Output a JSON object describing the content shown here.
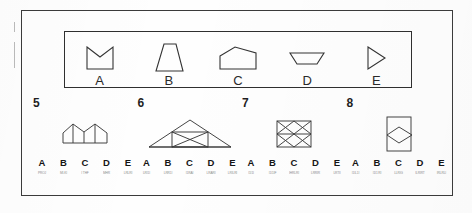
{
  "page": {
    "kind": "spatial-reasoning-test-sheet",
    "frame_color": "#3b3b3b",
    "ink_color": "#333333",
    "background_color": "#fefefe"
  },
  "answer_key": {
    "shapes": [
      {
        "label": "A",
        "icon": "square-with-v-notch-top-shape"
      },
      {
        "label": "B",
        "icon": "trapezoid-narrow-top-shape"
      },
      {
        "label": "C",
        "icon": "pentagon-house-shape"
      },
      {
        "label": "D",
        "icon": "shallow-inverted-trapezoid-shape"
      },
      {
        "label": "E",
        "icon": "right-pointing-triangle-shape"
      }
    ]
  },
  "problems": [
    {
      "number": "5",
      "figure_icon": "double-pentagon-roofline-figure",
      "options": [
        {
          "letter": "A",
          "mark": "PROJ"
        },
        {
          "letter": "B",
          "mark": "MI-KI"
        },
        {
          "letter": "C",
          "mark": "I THF"
        },
        {
          "letter": "D",
          "mark": "MHR"
        },
        {
          "letter": "E",
          "mark": "LRLRI"
        }
      ]
    },
    {
      "number": "6",
      "figure_icon": "triangle-with-inner-crossed-rectangle-figure",
      "options": [
        {
          "letter": "A",
          "mark": "LRI1I"
        },
        {
          "letter": "B",
          "mark": "LRR1I"
        },
        {
          "letter": "C",
          "mark": "I1RAI"
        },
        {
          "letter": "D",
          "mark": "LRARI"
        },
        {
          "letter": "E",
          "mark": "LRILRI"
        }
      ]
    },
    {
      "number": "7",
      "figure_icon": "rectangle-with-two-bowtie-crosses-figure",
      "options": [
        {
          "letter": "A",
          "mark": "I1I1I"
        },
        {
          "letter": "B",
          "mark": "I1I1IF"
        },
        {
          "letter": "C",
          "mark": "IHRLRI"
        },
        {
          "letter": "D",
          "mark": "LRRIR"
        },
        {
          "letter": "E",
          "mark": "LRTII"
        }
      ]
    },
    {
      "number": "8",
      "figure_icon": "rectangle-with-inner-diamond-figure",
      "options": [
        {
          "letter": "A",
          "mark": "I1IL1I"
        },
        {
          "letter": "B",
          "mark": "I1I1 RI"
        },
        {
          "letter": "C",
          "mark": "LLRIG"
        },
        {
          "letter": "D",
          "mark": "ILRIRT"
        },
        {
          "letter": "E",
          "mark": "IRLRLI"
        }
      ]
    }
  ]
}
